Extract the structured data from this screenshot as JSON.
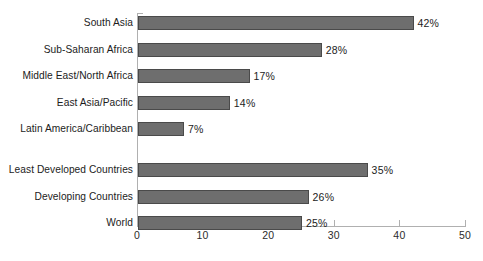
{
  "chart_data": {
    "type": "bar",
    "orientation": "horizontal",
    "title": "",
    "subtitle": "",
    "xlabel": "",
    "ylabel": "",
    "xlim": [
      0,
      50
    ],
    "grid": false,
    "legend": null,
    "value_suffix": "%",
    "categories": [
      "South Asia",
      "Sub-Saharan Africa",
      "Middle East/North Africa",
      "East Asia/Pacific",
      "Latin America/Caribbean",
      "Least Developed Countries",
      "Developing Countries",
      "World"
    ],
    "values": [
      42,
      28,
      17,
      14,
      7,
      35,
      26,
      25
    ],
    "value_labels": [
      "42%",
      "28%",
      "17%",
      "14%",
      "7%",
      "35%",
      "26%",
      "25%"
    ],
    "xticks": [
      0,
      10,
      20,
      30,
      40,
      50
    ],
    "xtick_labels": [
      "0",
      "10",
      "20",
      "30",
      "40",
      "50"
    ],
    "group_break_after_index": 4,
    "colors": {
      "bar_fill": "#6e6e6e",
      "bar_border": "#4a4a4a",
      "axis": "#b0b0b0",
      "text": "#1c1c1c",
      "background": "#ffffff"
    }
  }
}
